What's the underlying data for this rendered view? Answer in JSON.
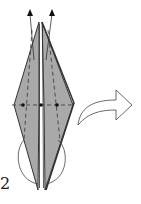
{
  "diagram": {
    "type": "origami-fold-step",
    "step_number": "2",
    "colors": {
      "paper": "#a9a9a9",
      "line": "#333333",
      "background": "#ffffff"
    },
    "symbols": [
      {
        "name": "fold-arrow-up-left",
        "kind": "arrow"
      },
      {
        "name": "fold-arrow-up-right",
        "kind": "arrow"
      },
      {
        "name": "valley-fold-lines",
        "kind": "dashed-line"
      },
      {
        "name": "reference-dots",
        "kind": "dot",
        "count": 3
      },
      {
        "name": "swing-loop",
        "kind": "curve"
      },
      {
        "name": "next-step-arrow",
        "kind": "hollow-arrow"
      }
    ]
  }
}
